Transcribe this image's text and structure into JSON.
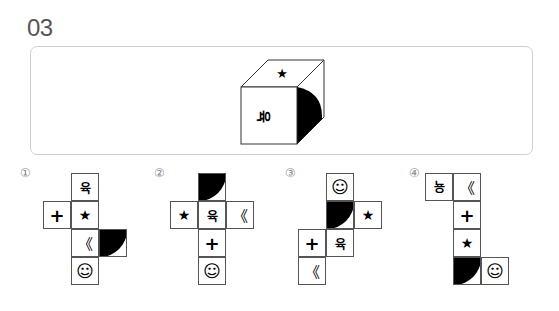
{
  "question": {
    "number": "03"
  },
  "cube": {
    "top_face": "★",
    "front_face": "육",
    "front_face_rotation": "rotated-90-cw",
    "right_face": "black-quarter-circle"
  },
  "options": [
    {
      "label": "①",
      "cells": [
        {
          "symbol": "육",
          "type": "korean",
          "x": 71,
          "y": 173
        },
        {
          "symbol": "+",
          "type": "plus",
          "x": 43,
          "y": 201
        },
        {
          "symbol": "★",
          "type": "star",
          "x": 71,
          "y": 201
        },
        {
          "symbol": "《",
          "type": "chev",
          "x": 71,
          "y": 229
        },
        {
          "symbol": "",
          "type": "quarter",
          "corner": "top-left",
          "x": 99,
          "y": 229
        },
        {
          "symbol": "☺",
          "type": "smile",
          "x": 71,
          "y": 257
        }
      ]
    },
    {
      "label": "②",
      "cells": [
        {
          "symbol": "",
          "type": "quarter",
          "corner": "top-left",
          "x": 198,
          "y": 173
        },
        {
          "symbol": "★",
          "type": "star",
          "x": 170,
          "y": 201
        },
        {
          "symbol": "육",
          "type": "korean",
          "x": 198,
          "y": 201
        },
        {
          "symbol": "《",
          "type": "chev",
          "x": 226,
          "y": 201
        },
        {
          "symbol": "+",
          "type": "plus",
          "x": 198,
          "y": 229
        },
        {
          "symbol": "☺",
          "type": "smile",
          "x": 198,
          "y": 257
        }
      ]
    },
    {
      "label": "③",
      "cells": [
        {
          "symbol": "☺",
          "type": "smile",
          "x": 326,
          "y": 173
        },
        {
          "symbol": "",
          "type": "quarter",
          "corner": "top-left",
          "x": 326,
          "y": 201
        },
        {
          "symbol": "★",
          "type": "star",
          "x": 354,
          "y": 201
        },
        {
          "symbol": "+",
          "type": "plus",
          "x": 298,
          "y": 229
        },
        {
          "symbol": "육",
          "type": "korean",
          "x": 326,
          "y": 229
        },
        {
          "symbol": "《",
          "type": "chev",
          "x": 298,
          "y": 257
        }
      ]
    },
    {
      "label": "④",
      "cells": [
        {
          "symbol": "육",
          "type": "korean-rot",
          "x": 425,
          "y": 173
        },
        {
          "symbol": "《",
          "type": "chev",
          "x": 453,
          "y": 173
        },
        {
          "symbol": "+",
          "type": "plus",
          "x": 453,
          "y": 201
        },
        {
          "symbol": "★",
          "type": "star",
          "x": 453,
          "y": 229
        },
        {
          "symbol": "",
          "type": "quarter",
          "corner": "top-left",
          "x": 453,
          "y": 257
        },
        {
          "symbol": "☺",
          "type": "smile",
          "x": 481,
          "y": 257
        }
      ]
    }
  ],
  "option_label_positions": [
    {
      "x": 20,
      "y": 166
    },
    {
      "x": 154,
      "y": 166
    },
    {
      "x": 285,
      "y": 166
    },
    {
      "x": 409,
      "y": 166
    }
  ]
}
